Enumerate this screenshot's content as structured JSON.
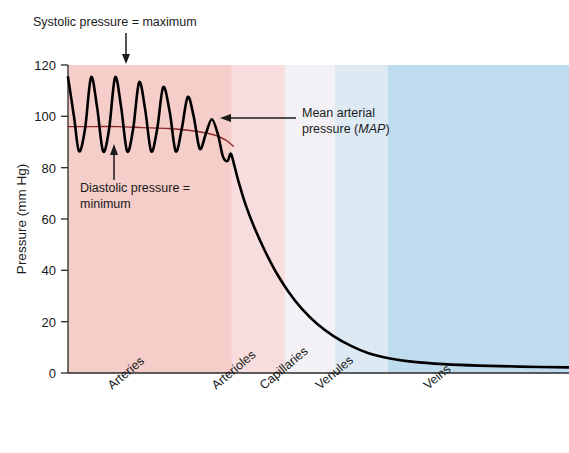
{
  "chart_data": {
    "type": "line",
    "title": "",
    "xlabel": "",
    "ylabel": "Pressure (mm Hg)",
    "ylim": [
      0,
      125
    ],
    "yticks": [
      0,
      20,
      40,
      60,
      80,
      100,
      120
    ],
    "ytick_labels": [
      "0",
      "20",
      "40",
      "60",
      "80",
      "100",
      "120"
    ],
    "grid": false,
    "legend_position": "none",
    "categories": [
      "Arteries",
      "Arterioles",
      "Capillaries",
      "Venules",
      "Veins"
    ],
    "band_colors": [
      "#f5cdc9",
      "#f8ddde",
      "#f3f1f6",
      "#ddeaf4",
      "#bfdcee"
    ],
    "band_fractions": [
      0.0,
      0.327,
      0.433,
      0.533,
      0.638,
      1.0
    ],
    "series": [
      {
        "name": "Pulsatile blood pressure",
        "color": "#000000",
        "systolic_peaks_mmhg": [
          120,
          120,
          120,
          118,
          116,
          112,
          103
        ],
        "diastolic_troughs_mmhg": [
          90,
          90,
          90,
          90,
          90,
          92,
          94
        ],
        "pulse_count": 7,
        "points": [
          [
            0.0,
            120
          ],
          [
            0.012,
            104
          ],
          [
            0.022,
            90
          ],
          [
            0.034,
            99
          ],
          [
            0.046,
            120
          ],
          [
            0.058,
            108
          ],
          [
            0.07,
            90
          ],
          [
            0.082,
            99
          ],
          [
            0.094,
            120
          ],
          [
            0.106,
            108
          ],
          [
            0.118,
            90
          ],
          [
            0.13,
            99
          ],
          [
            0.142,
            118
          ],
          [
            0.154,
            107
          ],
          [
            0.166,
            90
          ],
          [
            0.178,
            99
          ],
          [
            0.19,
            116
          ],
          [
            0.203,
            106
          ],
          [
            0.215,
            90
          ],
          [
            0.227,
            99
          ],
          [
            0.239,
            112
          ],
          [
            0.251,
            104
          ],
          [
            0.263,
            91
          ],
          [
            0.275,
            97
          ],
          [
            0.287,
            103
          ],
          [
            0.299,
            97
          ],
          [
            0.309,
            88
          ],
          [
            0.318,
            86
          ],
          [
            0.325,
            89
          ],
          [
            0.331,
            85
          ],
          [
            0.34,
            78
          ],
          [
            0.355,
            68
          ],
          [
            0.372,
            59
          ],
          [
            0.392,
            50
          ],
          [
            0.415,
            41
          ],
          [
            0.44,
            33
          ],
          [
            0.467,
            26
          ],
          [
            0.497,
            20
          ],
          [
            0.53,
            15
          ],
          [
            0.565,
            11
          ],
          [
            0.6,
            8
          ],
          [
            0.64,
            6
          ],
          [
            0.69,
            4.5
          ],
          [
            0.75,
            3.6
          ],
          [
            0.82,
            3.0
          ],
          [
            0.9,
            2.6
          ],
          [
            1.0,
            2.3
          ]
        ]
      },
      {
        "name": "Mean arterial pressure",
        "color": "#8c2b2b",
        "points": [
          [
            0.0,
            100
          ],
          [
            0.05,
            100
          ],
          [
            0.1,
            100
          ],
          [
            0.15,
            99.6
          ],
          [
            0.2,
            99.2
          ],
          [
            0.24,
            98.5
          ],
          [
            0.27,
            97.6
          ],
          [
            0.295,
            96.4
          ],
          [
            0.315,
            94.5
          ],
          [
            0.33,
            92.0
          ]
        ]
      }
    ],
    "annotations": [
      {
        "name": "systolic-annotation",
        "lines": [
          "Systolic pressure = maximum"
        ],
        "arrow": "down"
      },
      {
        "name": "diastolic-annotation",
        "lines": [
          "Diastolic pressure =",
          "minimum"
        ],
        "arrow": "up"
      },
      {
        "name": "map-annotation",
        "lines": [
          "Mean arterial",
          "pressure ("
        ],
        "italic_token": "MAP",
        "trailing": ")",
        "arrow": "left"
      }
    ]
  },
  "chart": {
    "y_axis_title": "Pressure (mm Hg)",
    "y_ticks": {
      "t0": "0",
      "t20": "20",
      "t40": "40",
      "t60": "60",
      "t80": "80",
      "t100": "100",
      "t120": "120"
    },
    "x_categories": {
      "c0": "Arteries",
      "c1": "Arterioles",
      "c2": "Capillaries",
      "c3": "Venules",
      "c4": "Veins"
    },
    "annotations": {
      "systolic": "Systolic pressure = maximum",
      "diastolic_line1": "Diastolic pressure =",
      "diastolic_line2": "minimum",
      "map_line1": "Mean arterial",
      "map_line2_pre": "pressure (",
      "map_line2_italic": "MAP",
      "map_line2_post": ")"
    }
  }
}
